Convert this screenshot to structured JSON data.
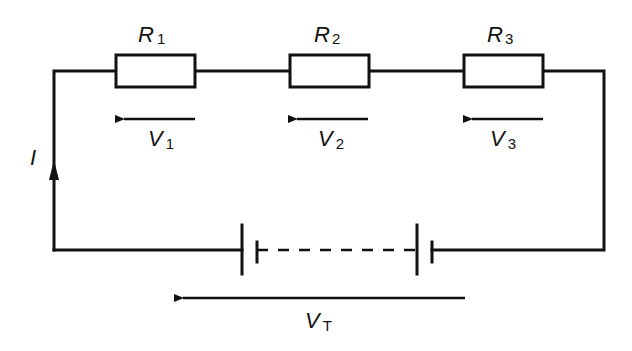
{
  "diagram": {
    "type": "series circuit",
    "current_label": "I",
    "resistors": [
      {
        "name": "R",
        "sub": "1",
        "voltage_name": "V",
        "voltage_sub": "1"
      },
      {
        "name": "R",
        "sub": "2",
        "voltage_name": "V",
        "voltage_sub": "2"
      },
      {
        "name": "R",
        "sub": "3",
        "voltage_name": "V",
        "voltage_sub": "3"
      }
    ],
    "total_voltage": {
      "name": "V",
      "sub": "T"
    },
    "battery": {
      "cells_shown": 2,
      "intermediate_cells": "dashed"
    },
    "colors": {
      "line": "#111111",
      "background": "#ffffff"
    }
  }
}
